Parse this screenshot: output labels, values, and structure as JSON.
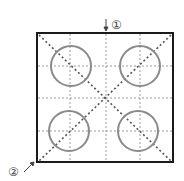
{
  "diagram": {
    "labels": {
      "marker1": "①",
      "marker2": "②"
    },
    "frame": {
      "x": 37,
      "y": 33,
      "w": 136,
      "h": 130,
      "color": "#1a1a1a"
    },
    "grid": {
      "xs": [
        70,
        106,
        140
      ],
      "ys": [
        66,
        98,
        131
      ],
      "color": "#999999"
    },
    "circles": [
      {
        "cx": 71,
        "cy": 66,
        "r": 20
      },
      {
        "cx": 140,
        "cy": 66,
        "r": 20
      },
      {
        "cx": 69,
        "cy": 131,
        "r": 20
      },
      {
        "cx": 138,
        "cy": 131,
        "r": 20
      }
    ],
    "circle_color": "#8a8a8a",
    "diagonal_color": "#555555"
  }
}
